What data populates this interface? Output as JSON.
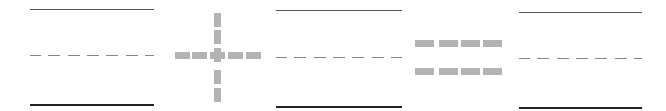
{
  "diagram": {
    "groups": [
      {
        "id": "group-1",
        "x": 30,
        "width": 124
      },
      {
        "id": "group-2",
        "x": 276,
        "width": 126
      },
      {
        "id": "group-3",
        "x": 519,
        "width": 123
      }
    ],
    "operators": [
      {
        "id": "plus",
        "symbol": "+",
        "center_x": 217,
        "center_y": 55
      },
      {
        "id": "equals",
        "symbol": "=",
        "x": 415,
        "width": 87
      }
    ],
    "colors": {
      "top_line": "#555555",
      "mid_line": "#888888",
      "bottom_line": "#222222",
      "operator": "#b3b3b3"
    }
  }
}
